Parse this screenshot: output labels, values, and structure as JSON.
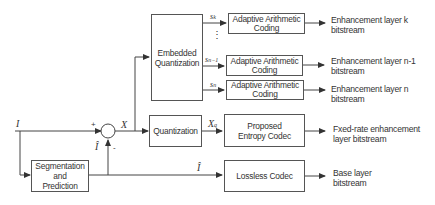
{
  "diagram": {
    "input_symbol": "I",
    "prediction_symbol": "Î",
    "residual_symbol": "X",
    "quantized_symbol": "X",
    "quantized_subscript": "q",
    "plus_sign": "+",
    "minus_sign": "-",
    "blocks": {
      "embedded_quantization": "Embedded Quantization",
      "quantization": "Quantization",
      "segmentation_prediction": [
        "Segmentation",
        "and",
        "Prediction"
      ],
      "aac_k": [
        "Adaptive Arithmetic",
        "Coding"
      ],
      "aac_n1": [
        "Adaptive Arithmetic",
        "Coding"
      ],
      "aac_n": [
        "Adaptive Arithmetic",
        "Coding"
      ],
      "entropy_codec": [
        "Proposed",
        "Entropy Codec"
      ],
      "lossless_codec": "Lossless Codec"
    },
    "subband_labels": {
      "k": {
        "base": "s",
        "sub": "k"
      },
      "n1": {
        "base": "s",
        "sub": "n−1"
      },
      "n": {
        "base": "s",
        "sub": "n"
      },
      "ellipsis": "⋮"
    },
    "outputs": {
      "layer_k": [
        "Enhancement layer k",
        "bitstream"
      ],
      "layer_n1": [
        "Enhancement layer n-1",
        "bitstream"
      ],
      "layer_n": [
        "Enhancement layer n",
        "bitstream"
      ],
      "fixed_rate": [
        "Fxed-rate enhancement",
        "layer bitstream"
      ],
      "base": [
        "Base layer",
        "bitstream"
      ]
    }
  }
}
